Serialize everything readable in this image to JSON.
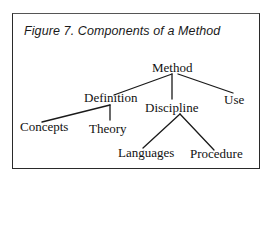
{
  "figure": {
    "title": "Figure 7. Components of a Method"
  },
  "tree": {
    "root": "Method",
    "nodes": {
      "method": "Method",
      "definition": "Definition",
      "discipline": "Discipline",
      "use": "Use",
      "concepts": "Concepts",
      "theory": "Theory",
      "languages": "Languages",
      "procedure": "Procedure"
    },
    "structure": [
      {
        "label": "Method",
        "children": [
          {
            "label": "Definition",
            "children": [
              {
                "label": "Concepts"
              },
              {
                "label": "Theory"
              }
            ]
          },
          {
            "label": "Discipline",
            "children": [
              {
                "label": "Languages"
              },
              {
                "label": "Procedure"
              }
            ]
          },
          {
            "label": "Use"
          }
        ]
      }
    ]
  },
  "colors": {
    "line": "#1a1a1a",
    "text": "#111111",
    "border": "#2a2a2a",
    "background": "#ffffff"
  }
}
